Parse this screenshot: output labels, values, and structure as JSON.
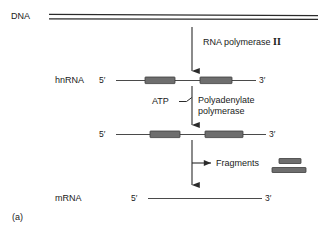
{
  "figure": {
    "panel_label": "(a)",
    "background_color": "#ffffff",
    "line_color": "#2b2b2b",
    "box_fill_color": "#6e6e6e",
    "box_stroke_color": "#3d3d3d",
    "text_color": "#1a1a1a"
  },
  "rows": {
    "dna": {
      "label": "DNA",
      "strand_type": "double-line"
    },
    "hnrna": {
      "label": "hnRNA",
      "five_prime": "5′",
      "three_prime": "3′",
      "boxes": 2
    },
    "polyadenylated": {
      "label": "",
      "five_prime": "5′",
      "three_prime": "3′",
      "boxes": 2
    },
    "mrna": {
      "label": "mRNA",
      "five_prime": "5′",
      "three_prime": "3′",
      "boxes": 0
    }
  },
  "annotations": {
    "step1_enzyme": "RNA polymerase II",
    "step1_enzyme_name": "RNA polymerase",
    "step1_enzyme_numeral": "II",
    "substrate": "ATP",
    "step2_enzyme_line1": "Polyadenylate",
    "step2_enzyme_line2": "polymerase",
    "step3_product": "Fragments"
  },
  "fragments": {
    "count": 2,
    "items": [
      {
        "name": "short-fragment",
        "width_px": 22,
        "height_px": 5
      },
      {
        "name": "long-fragment",
        "width_px": 34,
        "height_px": 5
      }
    ]
  }
}
